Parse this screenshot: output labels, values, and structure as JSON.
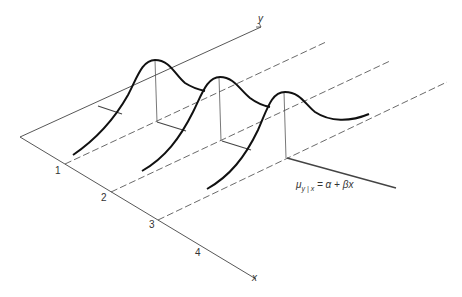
{
  "figure": {
    "axes": {
      "x_label": "x",
      "y_label": "y"
    },
    "x_ticks": [
      "1",
      "2",
      "3",
      "4"
    ],
    "equation": {
      "mu": "μ",
      "subscript": "y | x",
      "rhs": " = α + βx"
    },
    "colors": {
      "line": "#333333",
      "curve": "#111111",
      "background": "#ffffff"
    }
  }
}
